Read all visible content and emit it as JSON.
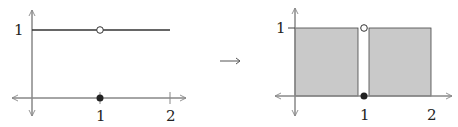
{
  "left_graph": {
    "y_tick_label": "1",
    "x_tick_labels": [
      "1",
      "2"
    ],
    "description": "constant function y=1 on [0,2] with hole at x=1 and point at (1,0)"
  },
  "arrow": {
    "glyph": "→"
  },
  "right_graph": {
    "y_tick_label": "1",
    "x_tick_labels": [
      "1",
      "2"
    ],
    "description": "shaded area under y=1 on [0,2] excluding a thin strip at x=1"
  },
  "colors": {
    "axis": "#888888",
    "line": "#333333",
    "shade": "#c9c9c9",
    "point_fill": "#222222",
    "hole_fill": "#ffffff"
  }
}
